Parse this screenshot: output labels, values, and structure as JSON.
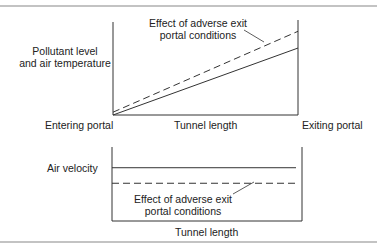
{
  "chart_data": [
    {
      "type": "line",
      "title": "",
      "ylabel": "Pollutant level and air temperature",
      "xlabel": "Tunnel length",
      "x_start_label": "Entering portal",
      "x_end_label": "Exiting portal",
      "x": [
        0,
        1
      ],
      "ylim": [
        0,
        1
      ],
      "series": [
        {
          "name": "Normal conditions",
          "style": "solid",
          "values": [
            0,
            0.72
          ]
        },
        {
          "name": "Effect of adverse exit portal conditions",
          "style": "dashed",
          "values": [
            0.03,
            0.9
          ]
        }
      ],
      "annotation": "Effect of adverse exit portal conditions"
    },
    {
      "type": "line",
      "title": "",
      "ylabel": "Air velocity",
      "xlabel": "Tunnel length",
      "x": [
        0,
        1
      ],
      "ylim": [
        0,
        1
      ],
      "series": [
        {
          "name": "Normal conditions",
          "style": "solid",
          "values": [
            0.72,
            0.72
          ]
        },
        {
          "name": "Effect of adverse exit portal conditions",
          "style": "dashed",
          "values": [
            0.51,
            0.51
          ]
        }
      ],
      "annotation": "Effect of adverse exit portal conditions"
    }
  ],
  "top": {
    "ylabel_line1": "Pollutant level",
    "ylabel_line2": "and air temperature",
    "annotation_line1": "Effect of adverse exit",
    "annotation_line2": "portal conditions",
    "x_start": "Entering portal",
    "x_mid": "Tunnel length",
    "x_end": "Exiting portal"
  },
  "bottom": {
    "ylabel": "Air velocity",
    "annotation_line1": "Effect of adverse exit",
    "annotation_line2": "portal conditions",
    "x_mid": "Tunnel length"
  },
  "colors": {
    "line": "#333333",
    "rule": "#777777"
  }
}
